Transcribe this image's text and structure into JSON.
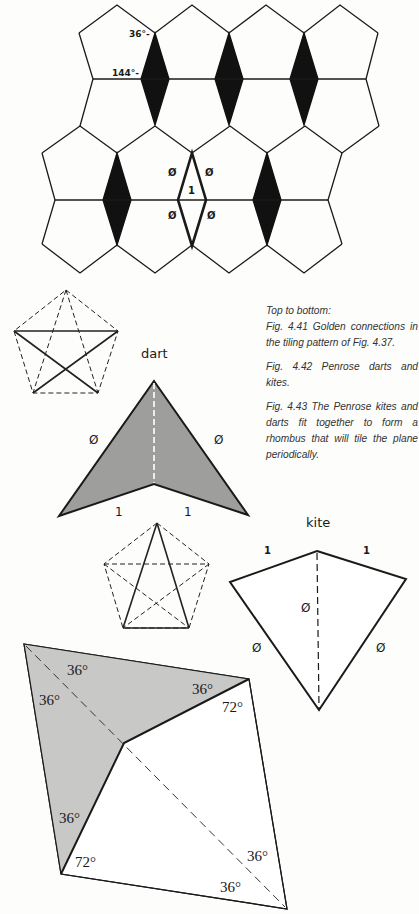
{
  "figure": {
    "caption": {
      "heading": "Top to bottom:",
      "fig_4_41": "Fig. 4.41  Golden connections in the tiling pattern of Fig. 4.37.",
      "fig_4_42": "Fig. 4.42   Penrose darts and kites.",
      "fig_4_43": "Fig. 4.43   The Penrose kites and darts fit together to form a rhombus that will tile the plane periodically."
    },
    "tiling": {
      "angle_top": "36°-",
      "angle_mid": "144°-",
      "phi_symbol": "Ø",
      "unit": "1",
      "diamond_color": "#111111"
    },
    "dart": {
      "title": "dart",
      "long_side": "Ø",
      "short_side": "1",
      "fill": "#9e9e9c"
    },
    "kite": {
      "title": "kite",
      "short_side": "1",
      "long_side": "Ø",
      "axis": "Ø"
    },
    "rhombus": {
      "fill": "#c8c8c6",
      "angles": [
        "36°",
        "36°",
        "36°",
        "72°",
        "36°",
        "72°",
        "36°",
        "36°"
      ]
    }
  }
}
